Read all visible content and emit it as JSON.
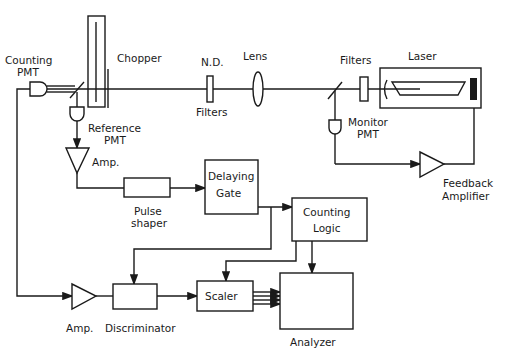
{
  "colors": {
    "line": "#1a1a1a",
    "background": "#ffffff"
  },
  "labels": {
    "counting_pmt_1": "Counting",
    "counting_pmt_2": "PMT",
    "chopper": "Chopper",
    "reference_pmt_1": "Reference",
    "reference_pmt_2": "PMT",
    "amp_top": "Amp.",
    "nd": "N.D.",
    "nd_filters": "Filters",
    "lens": "Lens",
    "filters": "Filters",
    "laser": "Laser",
    "monitor_pmt_1": "Monitor",
    "monitor_pmt_2": "PMT",
    "feedback_1": "Feedback",
    "feedback_2": "Amplifier",
    "pulse_shaper_1": "Pulse",
    "pulse_shaper_2": "shaper",
    "delaying_gate_1": "Delaying",
    "delaying_gate_2": "Gate",
    "counting_logic_1": "Counting",
    "counting_logic_2": "Logic",
    "amp_bottom": "Amp.",
    "discriminator": "Discriminator",
    "scaler": "Scaler",
    "analyzer": "Analyzer"
  }
}
